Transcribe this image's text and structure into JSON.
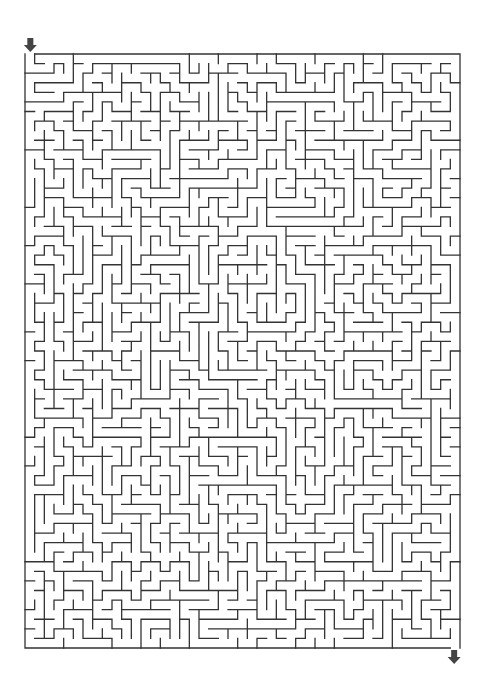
{
  "puzzle": {
    "type": "rectangular-maze",
    "columns": 45,
    "rows": 62,
    "seed": 48913,
    "bounds": {
      "left": 25,
      "top": 54,
      "right": 460,
      "bottom": 648
    },
    "entrance": {
      "position": "top-left",
      "column": 0,
      "arrow_direction": "down",
      "icon": "arrow-down-icon"
    },
    "exit": {
      "position": "bottom-right",
      "column": 44,
      "arrow_direction": "down",
      "icon": "arrow-down-icon"
    }
  },
  "colors": {
    "background": "#ffffff",
    "wall": "#333333",
    "arrow": "#444444"
  }
}
